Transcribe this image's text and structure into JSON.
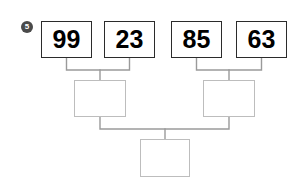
{
  "worksheet": {
    "problem_number": "5",
    "marker_icon": "circled-number-marker",
    "background_color": "#ffffff"
  },
  "diagram": {
    "type": "binary-merge-tree",
    "leaf_border_color": "#2b2b2b",
    "internal_border_color": "#bdbdbd",
    "connector_color": "#9a9a9a",
    "levels": [
      {
        "name": "leaves",
        "nodes": [
          {
            "id": "leaf-1",
            "value": "99",
            "filled": true,
            "x": 41,
            "y": 21,
            "w": 51,
            "h": 37
          },
          {
            "id": "leaf-2",
            "value": "23",
            "filled": true,
            "x": 104,
            "y": 21,
            "w": 51,
            "h": 37
          },
          {
            "id": "leaf-3",
            "value": "85",
            "filled": true,
            "x": 171,
            "y": 21,
            "w": 51,
            "h": 37
          },
          {
            "id": "leaf-4",
            "value": "63",
            "filled": true,
            "x": 236,
            "y": 21,
            "w": 51,
            "h": 37
          }
        ]
      },
      {
        "name": "intermediate",
        "nodes": [
          {
            "id": "mid-left",
            "value": "",
            "filled": false,
            "x": 74,
            "y": 80,
            "w": 52,
            "h": 37
          },
          {
            "id": "mid-right",
            "value": "",
            "filled": false,
            "x": 203,
            "y": 80,
            "w": 52,
            "h": 37
          }
        ]
      },
      {
        "name": "root",
        "nodes": [
          {
            "id": "root",
            "value": "",
            "filled": false,
            "x": 140,
            "y": 139,
            "w": 50,
            "h": 38
          }
        ]
      }
    ],
    "connections": [
      {
        "from": "leaf-1",
        "to": "mid-left"
      },
      {
        "from": "leaf-2",
        "to": "mid-left"
      },
      {
        "from": "leaf-3",
        "to": "mid-right"
      },
      {
        "from": "leaf-4",
        "to": "mid-right"
      },
      {
        "from": "mid-left",
        "to": "root"
      },
      {
        "from": "mid-right",
        "to": "root"
      }
    ]
  }
}
